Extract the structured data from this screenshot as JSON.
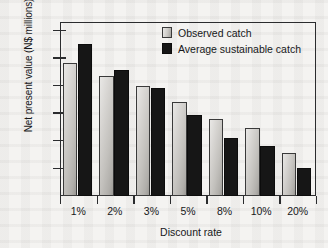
{
  "chart_data": {
    "type": "bar",
    "title": "",
    "xlabel": "Discount rate",
    "ylabel": "Net present value (N$ millions)",
    "categories": [
      "1%",
      "2%",
      "3%",
      "5%",
      "8%",
      "10%",
      "20%"
    ],
    "series": [
      {
        "name": "Observed catch",
        "color": "#c9c7c3",
        "values": [
          9650,
          8700,
          8000,
          6800,
          5600,
          4900,
          3100
        ]
      },
      {
        "name": "Average sustainable catch",
        "color": "#161616",
        "values": [
          11000,
          9150,
          7800,
          5900,
          4200,
          3600,
          2050
        ]
      }
    ],
    "ylim": [
      0,
      12600
    ],
    "yticks": [
      2000,
      4000,
      6000,
      8000,
      10000,
      12000
    ],
    "ytick_labels": [
      "2000",
      "4000",
      "6000",
      "8000",
      "10000",
      "12000"
    ],
    "grid": false,
    "legend_position": "top-right"
  },
  "legend": {
    "items": [
      {
        "label": "Observed catch",
        "swatch": "legend-swatch-observed"
      },
      {
        "label": "Average sustainable catch",
        "swatch": "legend-swatch-sustainable"
      }
    ]
  }
}
